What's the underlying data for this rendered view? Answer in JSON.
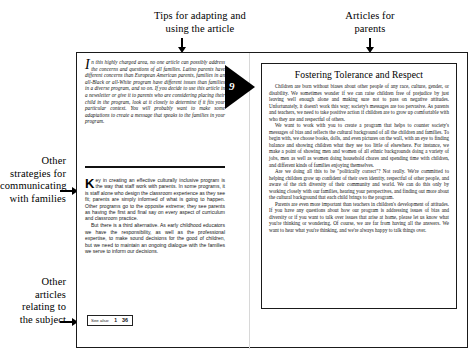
{
  "callouts": {
    "top_left": "Tips for adapting and\nusing the article",
    "top_right": "Articles for\nparents",
    "mid_left": "Other\nstrategies for\ncommunicating\nwith families",
    "bottom_left": "Other\narticles\nrelating to\nthe subject"
  },
  "page": {
    "flag_number": "9",
    "see_also": {
      "label": "See also:",
      "number_1": "1",
      "number_2": "36"
    }
  },
  "left_column": {
    "intro_dropcap": "I",
    "intro_paragraph": "n this highly charged area, no one article can possibly address the concerns and questions of all families. Latino parents have different concerns than European American parents, families in an all-Black or all-White program have different issues than families in a diverse program, and so on. If you decide to use this article in a newsletter or give it to parents who are considering placing their child in the program, look at it closely to determine if it fits your particular context. You will probably want to make some adaptations to create a message that speaks to the families in your program.",
    "body_dropcap": "K",
    "body_paragraph_1": "ey in creating an effective culturally inclusive program is the way that staff work with parents. In some programs, it is staff alone who design the classroom experience as they see fit; parents are simply informed of what is going to happen. Other programs go to the opposite extreme; they see parents as having the first and final say on every aspect of curriculum and classroom practice.",
    "body_paragraph_2": "But there is a third alternative. As early childhood educators we have the responsibility, as well as the professional expertise, to make sound decisions for the good of children, but we need to maintain an ongoing dialogue with the families we serve to inform our decisions."
  },
  "article": {
    "title": "Fostering Tolerance and Respect",
    "paragraphs": [
      "Children are born without biases about other people of any race, culture, gender, or disability. We sometimes wonder if we can raise children free of prejudice by just leaving well enough alone and making sure not to pass on negative attitudes. Unfortunately, it doesn't work this way; society's messages are too pervasive. As parents and teachers, we need to take positive action if children are to grow up comfortable with who they are and respectful of others.",
      "We want to work with you to create a program that helps to counter society's messages of bias and reflects the cultural background of all the children and families. To begin with, we choose books, dolls, and even pictures on the wall, with an eye to finding balance and showing children what they see too little of elsewhere. For instance, we make a point of showing men and women of all ethnic backgrounds doing a variety of jobs, men as well as women doing household chores and spending time with children, and different kinds of families enjoying themselves.",
      "Are we doing all this to be \"politically correct\"? Not really. We're committed to helping children grow up confident of their own identity, respectful of other people, and aware of the rich diversity of their community and world. We can do this only by working closely with our families, hearing your perspectives, and finding out more about the cultural background that each child brings to the program.",
      "Parents are even more important than teachers in children's development of attitudes. If you have any questions about how our program is addressing issues of bias and diversity or if you want to talk over issues that arise at home, please let us know what you're thinking or wondering. Of course, we are far from having all the answers. We want to hear what you're thinking, and we're always happy to talk things over."
    ]
  }
}
